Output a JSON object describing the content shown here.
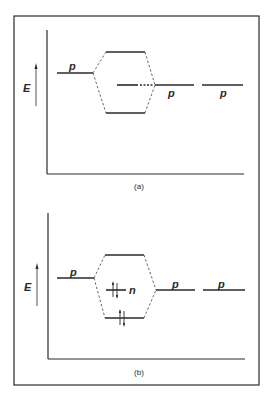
{
  "figure": {
    "ink_color": "#2a2a2a",
    "frame": {
      "x": 14,
      "y": 16,
      "w": 245,
      "h": 370
    }
  },
  "panels": [
    {
      "id": "a",
      "caption": "(a)",
      "axis_label": "E",
      "y_axis": {
        "x": 47,
        "y1": 30,
        "y2": 174
      },
      "x_axis": {
        "y": 174,
        "x1": 47,
        "x2": 244
      },
      "energy_arrow": {
        "x": 36,
        "y_top": 64,
        "y_bottom": 106
      },
      "left_orbital": {
        "label": "p",
        "x1": 57,
        "x2": 93,
        "y": 73
      },
      "mo_upper": {
        "x1": 106,
        "x2": 145,
        "y": 52
      },
      "mo_lower": {
        "x1": 106,
        "x2": 145,
        "y": 113
      },
      "nonbonding": {
        "style": "dash-dot",
        "x1": 117,
        "x2": 154,
        "y": 85,
        "electrons": []
      },
      "right_orbitals": [
        {
          "label": "p",
          "x1": 155,
          "x2": 194,
          "y": 85
        },
        {
          "label": "p",
          "x1": 202,
          "x2": 243,
          "y": 85
        }
      ]
    },
    {
      "id": "b",
      "caption": "(b)",
      "axis_label": "E",
      "y_axis": {
        "x": 48,
        "y1": 213,
        "y2": 359
      },
      "x_axis": {
        "y": 359,
        "x1": 48,
        "x2": 245
      },
      "energy_arrow": {
        "x": 37,
        "y_top": 264,
        "y_bottom": 306
      },
      "left_orbital": {
        "label": "p",
        "x1": 57,
        "x2": 94,
        "y": 278
      },
      "mo_upper": {
        "x1": 105,
        "x2": 144,
        "y": 255
      },
      "mo_lower": {
        "x1": 105,
        "x2": 144,
        "y": 318,
        "electrons": "↑↓"
      },
      "nonbonding": {
        "style": "solid",
        "label": "n",
        "x1": 106,
        "x2": 126,
        "y": 290,
        "electrons": "↑↓"
      },
      "right_orbitals": [
        {
          "label": "p",
          "x1": 156,
          "x2": 195,
          "y": 290
        },
        {
          "label": "p",
          "x1": 203,
          "x2": 245,
          "y": 290
        }
      ]
    }
  ]
}
